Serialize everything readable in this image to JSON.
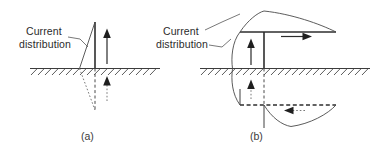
{
  "figure": {
    "background_color": "#ffffff",
    "line_color": "#404040",
    "text_color": "#2b2b2b"
  },
  "panels": [
    {
      "id": "a",
      "caption": "(a)",
      "label": {
        "line1": "Current",
        "line2": "distribution"
      },
      "antenna_type": "vertical monopole",
      "elements": {
        "ground_plane": "hatched horizontal ground plane",
        "mast": "vertical radiating element above ground",
        "image": "dashed image element below ground",
        "current_arrow_above": "upward current arrow",
        "current_arrow_below": "upward image current arrow",
        "distribution_shape": "triangular current taper"
      }
    },
    {
      "id": "b",
      "caption": "(b)",
      "label": {
        "line1": "Current",
        "line2": "distribution"
      },
      "antenna_type": "inverted-L antenna",
      "elements": {
        "ground_plane": "hatched horizontal ground plane",
        "mast": "vertical radiating element above ground",
        "horizontal_arm": "horizontal top-loading arm",
        "image": "dashed image of inverted-L below ground",
        "current_arrow_vertical": "upward current arrow on mast",
        "current_arrow_horizontal": "rightward current arrow on top arm",
        "image_arrow_vertical": "upward image current arrow",
        "image_arrow_horizontal": "leftward image current arrow",
        "distribution_shape": "curved sinusoidal current envelope"
      }
    }
  ]
}
